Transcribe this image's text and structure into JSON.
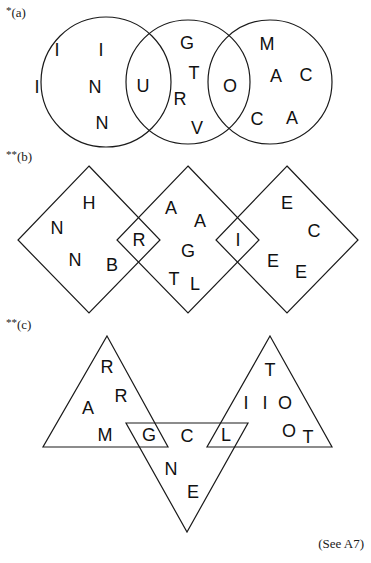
{
  "puzzles": [
    {
      "id": "a",
      "label": "(a)",
      "stars": "*",
      "shape_type": "circle",
      "shapes": [
        {
          "cx": 106,
          "cy": 82,
          "r": 65
        },
        {
          "cx": 188,
          "cy": 82,
          "r": 62
        },
        {
          "cx": 270,
          "cy": 82,
          "r": 62
        }
      ],
      "letters": [
        {
          "ch": "I",
          "x": 57,
          "y": 50
        },
        {
          "ch": "I",
          "x": 101,
          "y": 50
        },
        {
          "ch": "I",
          "x": 37,
          "y": 87
        },
        {
          "ch": "N",
          "x": 95,
          "y": 87
        },
        {
          "ch": "N",
          "x": 102,
          "y": 123
        },
        {
          "ch": "U",
          "x": 143,
          "y": 86
        },
        {
          "ch": "G",
          "x": 187,
          "y": 43
        },
        {
          "ch": "T",
          "x": 194,
          "y": 73
        },
        {
          "ch": "R",
          "x": 180,
          "y": 99
        },
        {
          "ch": "V",
          "x": 197,
          "y": 128
        },
        {
          "ch": "O",
          "x": 230,
          "y": 86
        },
        {
          "ch": "M",
          "x": 267,
          "y": 44
        },
        {
          "ch": "A",
          "x": 276,
          "y": 76
        },
        {
          "ch": "C",
          "x": 306,
          "y": 75
        },
        {
          "ch": "C",
          "x": 257,
          "y": 119
        },
        {
          "ch": "A",
          "x": 292,
          "y": 118
        }
      ]
    },
    {
      "id": "b",
      "label": "(b)",
      "stars": "**",
      "shape_type": "diamond",
      "shapes": [
        {
          "points": "89,166 160,240 89,313 18,240"
        },
        {
          "points": "188,166 259,240 188,313 117,240"
        },
        {
          "points": "287,166 358,240 287,313 216,240"
        }
      ],
      "letters": [
        {
          "ch": "H",
          "x": 89,
          "y": 203
        },
        {
          "ch": "N",
          "x": 57,
          "y": 228
        },
        {
          "ch": "N",
          "x": 75,
          "y": 260
        },
        {
          "ch": "B",
          "x": 112,
          "y": 265
        },
        {
          "ch": "R",
          "x": 139,
          "y": 240
        },
        {
          "ch": "A",
          "x": 171,
          "y": 208
        },
        {
          "ch": "A",
          "x": 200,
          "y": 221
        },
        {
          "ch": "G",
          "x": 188,
          "y": 251
        },
        {
          "ch": "T",
          "x": 174,
          "y": 279
        },
        {
          "ch": "L",
          "x": 195,
          "y": 284
        },
        {
          "ch": "I",
          "x": 238,
          "y": 240
        },
        {
          "ch": "E",
          "x": 287,
          "y": 203
        },
        {
          "ch": "C",
          "x": 314,
          "y": 231
        },
        {
          "ch": "E",
          "x": 273,
          "y": 261
        },
        {
          "ch": "E",
          "x": 301,
          "y": 272
        }
      ]
    },
    {
      "id": "c",
      "label": "(c)",
      "stars": "**",
      "shape_type": "triangle",
      "shapes": [
        {
          "points": "107,336 168,447 43,447"
        },
        {
          "points": "126,423 248,423 187,532"
        },
        {
          "points": "270,336 332,447 207,447"
        }
      ],
      "letters": [
        {
          "ch": "R",
          "x": 107,
          "y": 367
        },
        {
          "ch": "R",
          "x": 121,
          "y": 396
        },
        {
          "ch": "A",
          "x": 88,
          "y": 408
        },
        {
          "ch": "M",
          "x": 105,
          "y": 435
        },
        {
          "ch": "G",
          "x": 149,
          "y": 435
        },
        {
          "ch": "C",
          "x": 187,
          "y": 436
        },
        {
          "ch": "L",
          "x": 226,
          "y": 435
        },
        {
          "ch": "T",
          "x": 270,
          "y": 370
        },
        {
          "ch": "I",
          "x": 246,
          "y": 403
        },
        {
          "ch": "I",
          "x": 265,
          "y": 403
        },
        {
          "ch": "O",
          "x": 285,
          "y": 403
        },
        {
          "ch": "O",
          "x": 289,
          "y": 431
        },
        {
          "ch": "T",
          "x": 308,
          "y": 437
        },
        {
          "ch": "N",
          "x": 171,
          "y": 469
        },
        {
          "ch": "E",
          "x": 193,
          "y": 492
        }
      ]
    }
  ],
  "labels": [
    {
      "text_stars": "*",
      "text": "(a)",
      "x": 6,
      "y": 17
    },
    {
      "text_stars": "**",
      "text": "(b)",
      "x": 6,
      "y": 161
    },
    {
      "text_stars": "**",
      "text": "(c)",
      "x": 6,
      "y": 329
    }
  ],
  "footnote": "(See A7)",
  "colors": {
    "ink": "#1a1a1a",
    "background": "#ffffff"
  }
}
